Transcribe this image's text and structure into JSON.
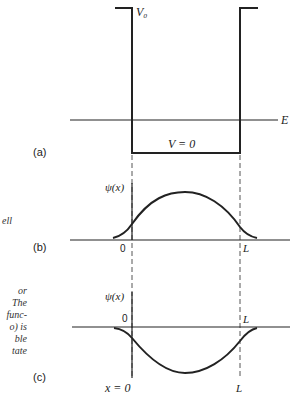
{
  "figure": {
    "panel_a": {
      "label": "(a)",
      "barrier_label": "V₀",
      "energy_label": "E",
      "well_label": "V = 0"
    },
    "panel_b": {
      "label": "(b)",
      "y_label": "ψ(x)",
      "origin_label": "0",
      "L_label": "L"
    },
    "panel_c": {
      "label": "(c)",
      "y_label": "ψ(x)",
      "origin_label": "0",
      "L_label_top": "L",
      "x0_label": "x = 0",
      "L_label_bottom": "L"
    },
    "caption_fragments": {
      "b": [
        "ell"
      ],
      "c": [
        "or",
        "The",
        "func-",
        "o) is",
        "ble",
        "tate"
      ]
    }
  },
  "colors": {
    "ink": "#222222",
    "dashed": "#555555"
  }
}
